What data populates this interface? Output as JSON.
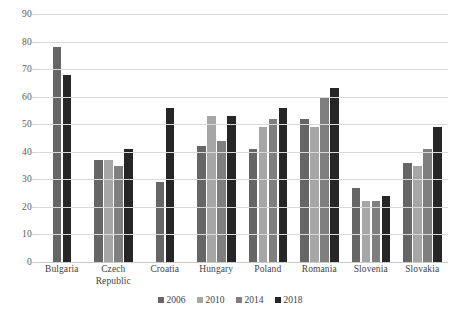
{
  "chart_data": {
    "type": "bar",
    "title": "",
    "subtitle": "",
    "xlabel": "",
    "ylabel": "",
    "ylim": [
      0,
      90
    ],
    "ytick_step": 10,
    "yticks": [
      "90",
      "80",
      "70",
      "60",
      "50",
      "40",
      "30",
      "20",
      "10",
      "0"
    ],
    "grid": true,
    "legend_position": "bottom",
    "categories": [
      "Bulgaria",
      "Czech Republic",
      "Croatia",
      "Hungary",
      "Poland",
      "Romania",
      "Slovenia",
      "Slovakia"
    ],
    "category_labels": [
      [
        "Bulgaria"
      ],
      [
        "Czech",
        "Republic"
      ],
      [
        "Croatia"
      ],
      [
        "Hungary"
      ],
      [
        "Poland"
      ],
      [
        "Romania"
      ],
      [
        "Slovenia"
      ],
      [
        "Slovakia"
      ]
    ],
    "series": [
      {
        "name": "2006",
        "color": "#666666",
        "values": [
          78,
          37,
          29,
          42,
          41,
          52,
          27,
          36
        ]
      },
      {
        "name": "2010",
        "color": "#a6a6a6",
        "values": [
          null,
          37,
          null,
          53,
          49,
          49,
          22,
          35
        ]
      },
      {
        "name": "2014",
        "color": "#7f7f7f",
        "values": [
          null,
          35,
          null,
          44,
          52,
          60,
          22,
          41
        ]
      },
      {
        "name": "2018",
        "color": "#262626",
        "values": [
          68,
          41,
          56,
          53,
          56,
          63,
          24,
          49
        ]
      }
    ]
  },
  "legend": {
    "items": [
      {
        "label": "2006",
        "color": "#666666"
      },
      {
        "label": "2010",
        "color": "#a6a6a6"
      },
      {
        "label": "2014",
        "color": "#7f7f7f"
      },
      {
        "label": "2018",
        "color": "#262626"
      }
    ]
  },
  "colors": {
    "background": "#ffffff",
    "gridline": "#d9d9d9",
    "tick_text": "#595959",
    "label_text": "#3f3f3f"
  }
}
